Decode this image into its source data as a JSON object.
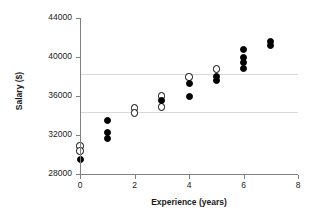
{
  "chart_data": {
    "type": "scatter",
    "title": "",
    "xlabel": "Experience (years)",
    "ylabel": "Salary ($)",
    "xlim": [
      0,
      8
    ],
    "ylim": [
      28000,
      44000
    ],
    "xticks": [
      0,
      2,
      4,
      6,
      8
    ],
    "xtick_labels": [
      "0",
      "2",
      "4",
      "6",
      "8"
    ],
    "yticks": [
      28000,
      32000,
      36000,
      40000,
      44000
    ],
    "ytick_labels": [
      "28000",
      "32000",
      "36000",
      "40000",
      "44000"
    ],
    "grid": "horizontal-light",
    "gridlines": [
      34400,
      38300
    ],
    "legend": "none",
    "series": [
      {
        "name": "open-circle-markers",
        "marker": "open circle",
        "points": [
          {
            "x": 0,
            "y": 30870
          },
          {
            "x": 0,
            "y": 30360
          },
          {
            "x": 2,
            "y": 34770
          },
          {
            "x": 2,
            "y": 34260
          },
          {
            "x": 3,
            "y": 36000
          },
          {
            "x": 3,
            "y": 34870
          },
          {
            "x": 4,
            "y": 37950
          },
          {
            "x": 5,
            "y": 38770
          }
        ]
      },
      {
        "name": "filled-circle-markers",
        "marker": "filled circle",
        "points": [
          {
            "x": 0,
            "y": 29440
          },
          {
            "x": 1,
            "y": 33440
          },
          {
            "x": 1,
            "y": 32210
          },
          {
            "x": 1,
            "y": 31590
          },
          {
            "x": 3,
            "y": 35490
          },
          {
            "x": 4,
            "y": 37330
          },
          {
            "x": 4,
            "y": 35900
          },
          {
            "x": 5,
            "y": 37950
          },
          {
            "x": 5,
            "y": 37540
          },
          {
            "x": 6,
            "y": 40720
          },
          {
            "x": 6,
            "y": 39900
          },
          {
            "x": 6,
            "y": 39390
          },
          {
            "x": 6,
            "y": 38870
          },
          {
            "x": 7,
            "y": 41640
          },
          {
            "x": 7,
            "y": 41130
          }
        ]
      }
    ],
    "colors": {
      "marker_fill": "#000000",
      "marker_edge": "#000000",
      "marker_open_fill": "#ffffff",
      "axis": "#808080",
      "gridline": "#d9d9d9",
      "text": "#1a1a1a",
      "background": "#ffffff"
    }
  }
}
